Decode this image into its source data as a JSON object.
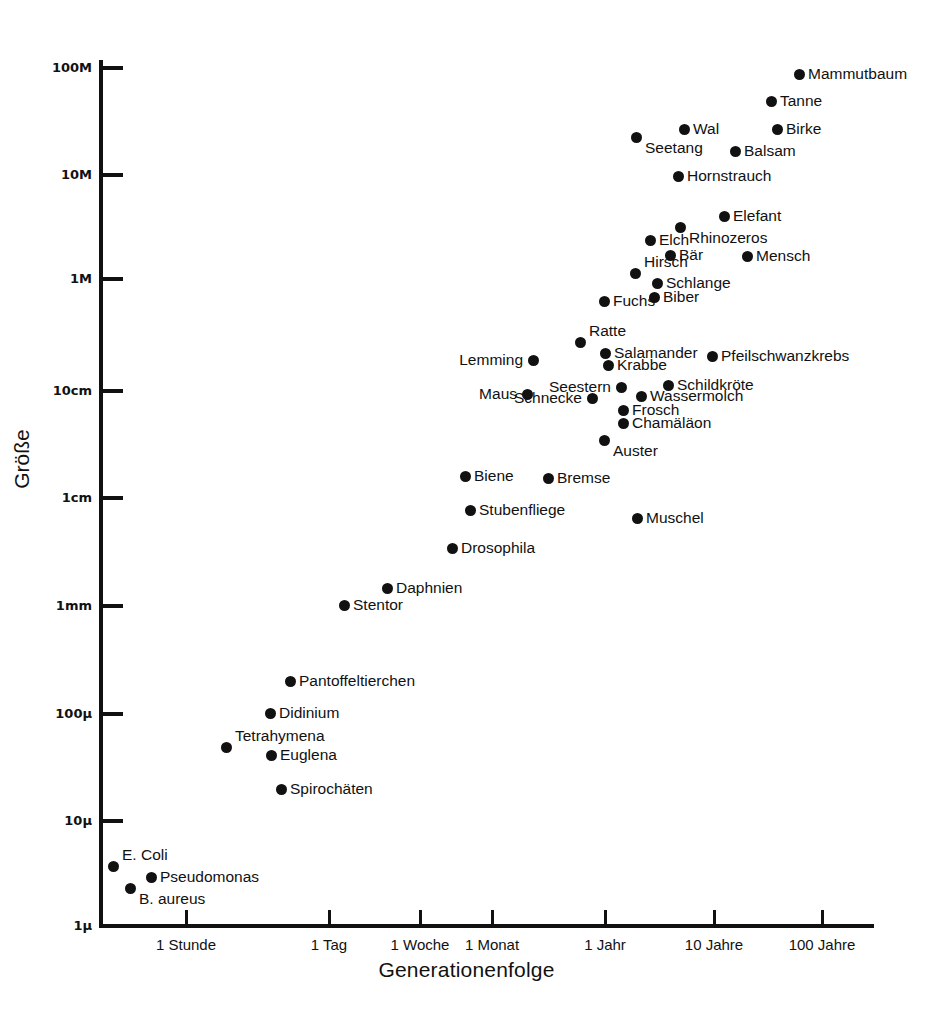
{
  "chart_data": {
    "type": "scatter",
    "title": "",
    "xlabel": "Generationenfolge",
    "ylabel": "Größe",
    "xscale": "log",
    "yscale": "log",
    "grid": false,
    "legend": null,
    "xticks": [
      {
        "label": "1 Stunde",
        "px": 186
      },
      {
        "label": "1 Tag",
        "px": 329
      },
      {
        "label": "1 Woche",
        "px": 420
      },
      {
        "label": "1 Monat",
        "px": 492
      },
      {
        "label": "1 Jahr",
        "px": 605
      },
      {
        "label": "10 Jahre",
        "px": 714
      },
      {
        "label": "100 Jahre",
        "px": 822
      }
    ],
    "yticks": [
      {
        "label": "100M",
        "px": 68
      },
      {
        "label": "10M",
        "px": 175
      },
      {
        "label": "1M",
        "px": 279
      },
      {
        "label": "10cm",
        "px": 391
      },
      {
        "label": "1cm",
        "px": 498
      },
      {
        "label": "1mm",
        "px": 606
      },
      {
        "label": "100μ",
        "px": 714
      },
      {
        "label": "10μ",
        "px": 821
      },
      {
        "label": "1μ",
        "px": 926
      }
    ],
    "points": [
      {
        "name": "Mammutbaum",
        "x": 799,
        "y": 74,
        "side": "right"
      },
      {
        "name": "Tanne",
        "x": 771,
        "y": 101,
        "side": "right"
      },
      {
        "name": "Wal",
        "x": 684,
        "y": 129,
        "side": "right"
      },
      {
        "name": "Birke",
        "x": 777,
        "y": 129,
        "side": "right"
      },
      {
        "name": "Seetang",
        "x": 636,
        "y": 137,
        "side": "below-right"
      },
      {
        "name": "Balsam",
        "x": 735,
        "y": 151,
        "side": "right"
      },
      {
        "name": "Hornstrauch",
        "x": 678,
        "y": 176,
        "side": "right"
      },
      {
        "name": "Elefant",
        "x": 724,
        "y": 216,
        "side": "right"
      },
      {
        "name": "Rhinozeros",
        "x": 680,
        "y": 227,
        "side": "below-right"
      },
      {
        "name": "Elch",
        "x": 650,
        "y": 240,
        "side": "right"
      },
      {
        "name": "Bär",
        "x": 670,
        "y": 255,
        "side": "right"
      },
      {
        "name": "Mensch",
        "x": 747,
        "y": 256,
        "side": "right"
      },
      {
        "name": "Hirsch",
        "x": 635,
        "y": 273,
        "side": "above-right"
      },
      {
        "name": "Schlange",
        "x": 657,
        "y": 283,
        "side": "right"
      },
      {
        "name": "Biber",
        "x": 654,
        "y": 297,
        "side": "right"
      },
      {
        "name": "Fuchs",
        "x": 604,
        "y": 301,
        "side": "right"
      },
      {
        "name": "Ratte",
        "x": 580,
        "y": 342,
        "side": "above-right"
      },
      {
        "name": "Salamander",
        "x": 605,
        "y": 353,
        "side": "right"
      },
      {
        "name": "Pfeilschwanzkrebs",
        "x": 712,
        "y": 356,
        "side": "right"
      },
      {
        "name": "Lemming",
        "x": 533,
        "y": 360,
        "side": "left"
      },
      {
        "name": "Krabbe",
        "x": 608,
        "y": 365,
        "side": "right"
      },
      {
        "name": "Schildkröte",
        "x": 668,
        "y": 385,
        "side": "right"
      },
      {
        "name": "Seestern",
        "x": 621,
        "y": 387,
        "side": "left"
      },
      {
        "name": "Maus",
        "x": 527,
        "y": 394,
        "side": "left"
      },
      {
        "name": "Wassermolch",
        "x": 641,
        "y": 396,
        "side": "right"
      },
      {
        "name": "Schnecke",
        "x": 592,
        "y": 398,
        "side": "left"
      },
      {
        "name": "Frosch",
        "x": 623,
        "y": 410,
        "side": "right"
      },
      {
        "name": "Chamäläon",
        "x": 623,
        "y": 423,
        "side": "right"
      },
      {
        "name": "Auster",
        "x": 604,
        "y": 440,
        "side": "below-right"
      },
      {
        "name": "Biene",
        "x": 465,
        "y": 476,
        "side": "right"
      },
      {
        "name": "Bremse",
        "x": 548,
        "y": 478,
        "side": "right"
      },
      {
        "name": "Stubenfliege",
        "x": 470,
        "y": 510,
        "side": "right"
      },
      {
        "name": "Muschel",
        "x": 637,
        "y": 518,
        "side": "right"
      },
      {
        "name": "Drosophila",
        "x": 452,
        "y": 548,
        "side": "right"
      },
      {
        "name": "Daphnien",
        "x": 387,
        "y": 588,
        "side": "right"
      },
      {
        "name": "Stentor",
        "x": 344,
        "y": 605,
        "side": "right"
      },
      {
        "name": "Pantoffeltierchen",
        "x": 290,
        "y": 681,
        "side": "right"
      },
      {
        "name": "Didinium",
        "x": 270,
        "y": 713,
        "side": "right"
      },
      {
        "name": "Tetrahymena",
        "x": 226,
        "y": 747,
        "side": "above-right"
      },
      {
        "name": "Euglena",
        "x": 271,
        "y": 755,
        "side": "right"
      },
      {
        "name": "Spirochäten",
        "x": 281,
        "y": 789,
        "side": "right"
      },
      {
        "name": "E. Coli",
        "x": 113,
        "y": 866,
        "side": "above-right"
      },
      {
        "name": "Pseudomonas",
        "x": 151,
        "y": 877,
        "side": "right"
      },
      {
        "name": "B. aureus",
        "x": 130,
        "y": 888,
        "side": "below-right"
      }
    ]
  },
  "colors": {
    "ink": "#111111",
    "background": "#ffffff"
  }
}
